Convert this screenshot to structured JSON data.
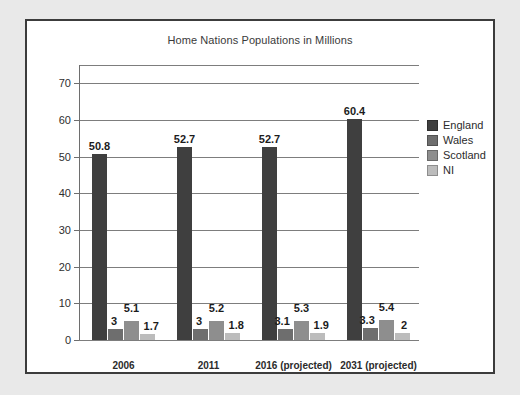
{
  "chart_data": {
    "type": "bar",
    "title": "Home Nations Populations in Millions",
    "xlabel": "",
    "ylabel": "",
    "ylim": [
      0,
      75
    ],
    "yticks": [
      0,
      10,
      20,
      30,
      40,
      50,
      60,
      70
    ],
    "grid": true,
    "legend_position": "right",
    "categories": [
      "2006",
      "2011",
      "2016 (projected)",
      "2031 (projected)"
    ],
    "series": [
      {
        "name": "England",
        "color": "#3f3f3f",
        "values": [
          50.8,
          52.7,
          52.7,
          60.4
        ],
        "labels": [
          "50.8",
          "52.7",
          "52.7",
          "60.4"
        ]
      },
      {
        "name": "Wales",
        "color": "#6e6e6e",
        "values": [
          3,
          3,
          3.1,
          3.3
        ],
        "labels": [
          "3",
          "3",
          "3.1",
          "3.3"
        ]
      },
      {
        "name": "Scotland",
        "color": "#8e8e8e",
        "values": [
          5.1,
          5.2,
          5.3,
          5.4
        ],
        "labels": [
          "5.1",
          "5.2",
          "5.3",
          "5.4"
        ]
      },
      {
        "name": "NI",
        "color": "#bcbcbc",
        "values": [
          1.7,
          1.8,
          1.9,
          2
        ],
        "labels": [
          "1.7",
          "1.8",
          "1.9",
          "2"
        ]
      }
    ]
  }
}
